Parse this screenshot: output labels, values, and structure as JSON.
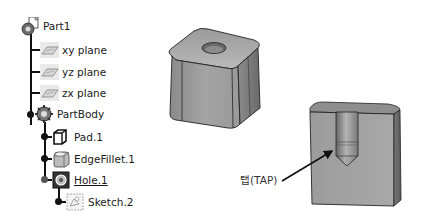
{
  "spec_tree": {
    "root": {
      "label": "Part1",
      "icon": "part-icon"
    },
    "planes": [
      {
        "label": "xy plane",
        "icon": "plane-icon"
      },
      {
        "label": "yz plane",
        "icon": "plane-icon"
      },
      {
        "label": "zx plane",
        "icon": "plane-icon"
      }
    ],
    "body": {
      "label": "PartBody",
      "icon": "body-gear-icon"
    },
    "features": [
      {
        "label": "Pad.1",
        "icon": "pad-icon"
      },
      {
        "label": "EdgeFillet.1",
        "icon": "edge-fillet-icon"
      },
      {
        "label": "Hole.1",
        "icon": "hole-icon",
        "underlined": true
      }
    ],
    "hole_children": [
      {
        "label": "Sketch.2",
        "icon": "sketch-icon"
      }
    ]
  },
  "viewport": {
    "models": [
      {
        "name": "filleted-block-with-hole",
        "description": "Rounded square block with through-hole on top face"
      },
      {
        "name": "sectioned-block-tapped-hole",
        "description": "Section view showing tapped blind hole with drill point"
      }
    ],
    "callout": {
      "label": "탭(TAP)"
    }
  },
  "colors": {
    "solid_face_light": "#b8b8b8",
    "solid_face_mid": "#9a9a9a",
    "solid_face_dark": "#6e6e6e",
    "edge": "#1e1e1e",
    "tree_line": "#111111"
  }
}
